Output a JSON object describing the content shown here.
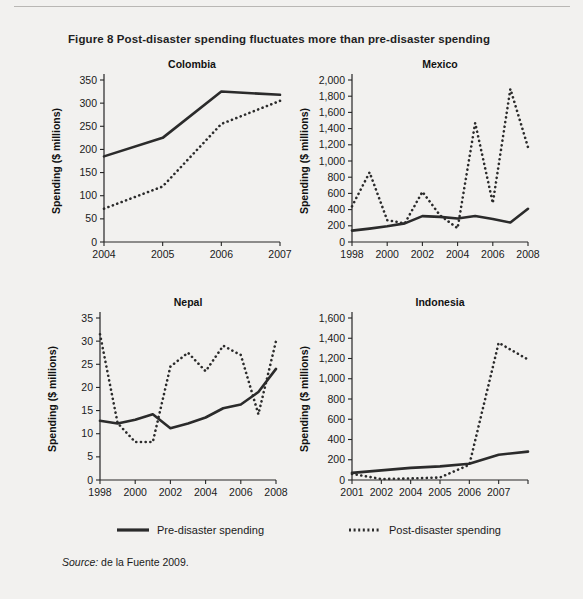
{
  "figure": {
    "title": "Figure 8  Post-disaster spending fluctuates more than pre-disaster spending",
    "source_label": "Source:",
    "source_text": " de la Fuente 2009.",
    "y_axis_title": "Spending ($ millions)"
  },
  "legend": {
    "pre_label": "Pre-disaster spending",
    "post_label": "Post-disaster spending",
    "pre_style": "solid",
    "post_style": "dotted",
    "line_color": "#2b2b2b"
  },
  "chart_data": [
    {
      "type": "line",
      "title": "Colombia",
      "xlabel": "",
      "ylabel": "Spending ($ millions)",
      "x": [
        2004,
        2005,
        2006,
        2007
      ],
      "xticks": [
        "2004",
        "2005",
        "2006",
        "2007"
      ],
      "yticks": [
        0,
        50,
        100,
        150,
        200,
        250,
        300,
        350
      ],
      "ytick_labels": [
        "0",
        "50",
        "100",
        "150",
        "200",
        "250",
        "300",
        "350"
      ],
      "ylim": [
        0,
        350
      ],
      "grid": false,
      "legend_position": "figure-bottom",
      "series": [
        {
          "name": "Pre-disaster spending",
          "style": "solid",
          "values": [
            185,
            225,
            325,
            318
          ]
        },
        {
          "name": "Post-disaster spending",
          "style": "dotted",
          "values": [
            72,
            120,
            255,
            305
          ]
        }
      ]
    },
    {
      "type": "line",
      "title": "Mexico",
      "xlabel": "",
      "ylabel": "Spending ($ millions)",
      "x": [
        1998,
        1999,
        2000,
        2001,
        2002,
        2003,
        2004,
        2005,
        2006,
        2007,
        2008
      ],
      "xticks": [
        "1998",
        "2000",
        "2002",
        "2004",
        "2006",
        "2008"
      ],
      "xtick_values": [
        1998,
        2000,
        2002,
        2004,
        2006,
        2008
      ],
      "yticks": [
        0,
        200,
        400,
        600,
        800,
        1000,
        1200,
        1400,
        1600,
        1800,
        2000
      ],
      "ytick_labels": [
        "0",
        "200",
        "400",
        "600",
        "800",
        "1,000",
        "1,200",
        "1,400",
        "1,600",
        "1,800",
        "2,000"
      ],
      "ylim": [
        0,
        2000
      ],
      "grid": false,
      "legend_position": "figure-bottom",
      "series": [
        {
          "name": "Pre-disaster spending",
          "style": "solid",
          "values": [
            140,
            165,
            195,
            230,
            320,
            310,
            290,
            320,
            285,
            240,
            410
          ]
        },
        {
          "name": "Post-disaster spending",
          "style": "dotted",
          "values": [
            440,
            860,
            270,
            230,
            620,
            330,
            170,
            1470,
            480,
            1890,
            1170
          ]
        }
      ]
    },
    {
      "type": "line",
      "title": "Nepal",
      "xlabel": "",
      "ylabel": "Spending ($ millions)",
      "x": [
        1998,
        1999,
        2000,
        2001,
        2002,
        2003,
        2004,
        2005,
        2006,
        2007,
        2008
      ],
      "xticks": [
        "1998",
        "2000",
        "2002",
        "2004",
        "2006",
        "2008"
      ],
      "xtick_values": [
        1998,
        2000,
        2002,
        2004,
        2006,
        2008
      ],
      "yticks": [
        0,
        5,
        10,
        15,
        20,
        25,
        30,
        35
      ],
      "ytick_labels": [
        "0",
        "5",
        "10",
        "15",
        "20",
        "25",
        "30",
        "35"
      ],
      "ylim": [
        0,
        35
      ],
      "grid": false,
      "legend_position": "figure-bottom",
      "series": [
        {
          "name": "Pre-disaster spending",
          "style": "solid",
          "values": [
            12.8,
            12.2,
            13.0,
            14.2,
            11.2,
            12.2,
            13.5,
            15.5,
            16.3,
            19.0,
            24.0
          ]
        },
        {
          "name": "Post-disaster spending",
          "style": "dotted",
          "values": [
            31.5,
            12.3,
            8.2,
            8.2,
            24.5,
            27.5,
            23.5,
            29.0,
            27.0,
            14.2,
            30.0
          ]
        }
      ]
    },
    {
      "type": "line",
      "title": "Indonesia",
      "xlabel": "",
      "ylabel": "Spending ($ millions)",
      "x": [
        2001,
        2002,
        2003,
        2004,
        2005,
        2006,
        2007
      ],
      "xticks": [
        "2001",
        "2002",
        "2004",
        "2005",
        "2006",
        "2007"
      ],
      "xtick_values": [
        2001,
        2002,
        2003,
        2004,
        2005,
        2006,
        2007
      ],
      "yticks": [
        0,
        200,
        400,
        600,
        800,
        1000,
        1200,
        1400,
        1600
      ],
      "ytick_labels": [
        "0",
        "200",
        "400",
        "600",
        "800",
        "1,000",
        "1,200",
        "1,400",
        "1,600"
      ],
      "ylim": [
        0,
        1600
      ],
      "grid": false,
      "legend_position": "figure-bottom",
      "series": [
        {
          "name": "Pre-disaster spending",
          "style": "solid",
          "values": [
            70,
            95,
            120,
            135,
            160,
            250,
            280
          ]
        },
        {
          "name": "Post-disaster spending",
          "style": "dotted",
          "values": [
            60,
            10,
            15,
            25,
            150,
            1355,
            1190
          ]
        }
      ]
    }
  ]
}
